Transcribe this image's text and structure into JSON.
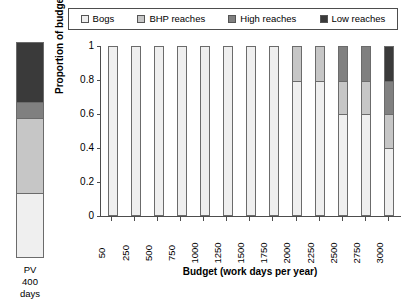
{
  "legend": {
    "entries": [
      {
        "label": "Bogs",
        "color": "#efefef"
      },
      {
        "label": "BHP reaches",
        "color": "#c6c6c6"
      },
      {
        "label": "High reaches",
        "color": "#808080"
      },
      {
        "label": "Low reaches",
        "color": "#3a3a3a"
      }
    ]
  },
  "pv": {
    "caption_line1": "PV",
    "caption_line2": "400",
    "caption_line3": "days",
    "segments": [
      {
        "name": "Low reaches",
        "value": 0.28,
        "color": "#3a3a3a"
      },
      {
        "name": "High reaches",
        "value": 0.07,
        "color": "#808080"
      },
      {
        "name": "BHP reaches",
        "value": 0.35,
        "color": "#c6c6c6"
      },
      {
        "name": "Bogs",
        "value": 0.3,
        "color": "#efefef"
      }
    ]
  },
  "chart_data": {
    "type": "bar",
    "stacked": true,
    "title": "",
    "xlabel": "Budget (work days per year)",
    "ylabel": "Proportion of budget",
    "ylim": [
      0,
      1
    ],
    "yticks": [
      "0",
      "0.2",
      "0.4",
      "0.6",
      "0.8",
      "1"
    ],
    "grid": false,
    "legend_position": "top",
    "categories": [
      "50",
      "250",
      "500",
      "750",
      "1000",
      "1250",
      "1500",
      "1750",
      "2000",
      "2250",
      "2500",
      "2750",
      "3000"
    ],
    "series": [
      {
        "name": "Bogs",
        "color": "#efefef",
        "values": [
          1.0,
          1.0,
          1.0,
          1.0,
          1.0,
          1.0,
          1.0,
          1.0,
          0.8,
          0.8,
          0.6,
          0.6,
          0.4
        ]
      },
      {
        "name": "BHP reaches",
        "color": "#c6c6c6",
        "values": [
          0.0,
          0.0,
          0.0,
          0.0,
          0.0,
          0.0,
          0.0,
          0.0,
          0.2,
          0.2,
          0.2,
          0.2,
          0.2
        ]
      },
      {
        "name": "High reaches",
        "color": "#808080",
        "values": [
          0.0,
          0.0,
          0.0,
          0.0,
          0.0,
          0.0,
          0.0,
          0.0,
          0.0,
          0.0,
          0.2,
          0.2,
          0.2
        ]
      },
      {
        "name": "Low reaches",
        "color": "#3a3a3a",
        "values": [
          0.0,
          0.0,
          0.0,
          0.0,
          0.0,
          0.0,
          0.0,
          0.0,
          0.0,
          0.0,
          0.0,
          0.0,
          0.2
        ]
      }
    ]
  }
}
